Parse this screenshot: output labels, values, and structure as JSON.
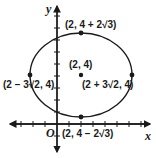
{
  "diagram": {
    "type": "ellipse-graph",
    "axes": {
      "x_label": "x",
      "y_label": "y",
      "origin_label": "O"
    },
    "center": {
      "label": "(2, 4)",
      "x": 2,
      "y": 4
    },
    "points": [
      {
        "id": "top",
        "label": "(2, 4 + 2√3)"
      },
      {
        "id": "bottom",
        "label": "(2, 4 − 2√3)"
      },
      {
        "id": "left",
        "label": "(2 − 3√2, 4)"
      },
      {
        "id": "right",
        "label": "(2 + 3√2, 4)"
      }
    ],
    "colors": {
      "stroke": "#1a1a1a",
      "background": "#ffffff"
    }
  }
}
